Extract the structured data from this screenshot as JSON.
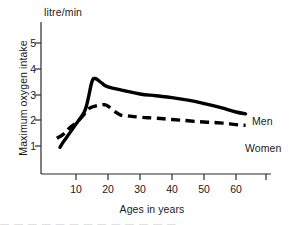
{
  "chart_data": {
    "type": "line",
    "title": "",
    "unit_label": "litre/min",
    "xlabel": "Ages in years",
    "ylabel": "Maximum oxygen intake",
    "xlim": [
      0,
      68
    ],
    "ylim": [
      0,
      5.6
    ],
    "xticks": [
      10,
      20,
      30,
      40,
      50,
      60
    ],
    "yticks": [
      1,
      2,
      3,
      4,
      5
    ],
    "grid": false,
    "legend_position": "right-inline",
    "series": [
      {
        "name": "Men",
        "style": "solid",
        "color": "#000000",
        "x": [
          5,
          6,
          8,
          10,
          12,
          13,
          14,
          15,
          16,
          18,
          20,
          25,
          30,
          35,
          40,
          45,
          50,
          55,
          60,
          63
        ],
        "values": [
          0.95,
          1.15,
          1.5,
          1.85,
          2.2,
          2.45,
          2.95,
          3.5,
          3.62,
          3.45,
          3.3,
          3.15,
          3.02,
          2.95,
          2.88,
          2.78,
          2.65,
          2.5,
          2.32,
          2.25
        ]
      },
      {
        "name": "Women",
        "style": "dashed",
        "color": "#000000",
        "x": [
          4,
          6,
          8,
          10,
          12,
          14,
          16,
          18,
          19,
          20,
          22,
          24,
          26,
          30,
          35,
          40,
          45,
          50,
          55,
          60,
          63
        ],
        "values": [
          1.3,
          1.45,
          1.7,
          1.9,
          2.15,
          2.45,
          2.55,
          2.6,
          2.6,
          2.55,
          2.35,
          2.2,
          2.17,
          2.12,
          2.08,
          2.03,
          1.98,
          1.93,
          1.9,
          1.83,
          1.8
        ]
      }
    ],
    "annotations": [
      {
        "text": "Men",
        "x": 64,
        "y": 2.35
      },
      {
        "text": "Women",
        "x": 64,
        "y": 1.75
      }
    ]
  },
  "axes": {
    "ytick_labels": [
      "5",
      "4",
      "3",
      "2",
      "1"
    ],
    "xtick_labels": [
      "10",
      "20",
      "30",
      "40",
      "50",
      "60"
    ]
  },
  "artifacts": {
    "bottom_scan_text": "— — —   — —    — — — —      — —   — —"
  }
}
